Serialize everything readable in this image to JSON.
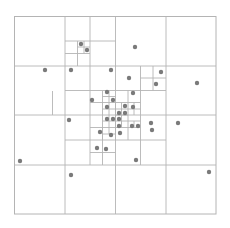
{
  "diagram": {
    "type": "quadtree",
    "line_color": "#b4b4b4",
    "point_color": "#7a7a7a",
    "point_radius": 2.2,
    "bounds": {
      "x": 14.5,
      "y": 16.5,
      "w": 201.5,
      "h": 197.5
    },
    "lines": [
      [
        65,
        16.5,
        65,
        214
      ],
      [
        115.5,
        16.5,
        115.5,
        214
      ],
      [
        166,
        16.5,
        166,
        214
      ],
      [
        14.5,
        66,
        216,
        66
      ],
      [
        14.5,
        115,
        216,
        115
      ],
      [
        14.5,
        165,
        216,
        165
      ],
      [
        90,
        16.5,
        90,
        66
      ],
      [
        65,
        41,
        115.5,
        41
      ],
      [
        77.5,
        41,
        77.5,
        66
      ],
      [
        65,
        53.5,
        90,
        53.5
      ],
      [
        84,
        41,
        84,
        53.5
      ],
      [
        77.5,
        47,
        90,
        47
      ],
      [
        140.5,
        66,
        140.5,
        115
      ],
      [
        115.5,
        90.5,
        166,
        90.5
      ],
      [
        153,
        66,
        153,
        90.5
      ],
      [
        140.5,
        78,
        166,
        78
      ],
      [
        90,
        66,
        90,
        165
      ],
      [
        65,
        90.5,
        115.5,
        90.5
      ],
      [
        65,
        140,
        166,
        140
      ],
      [
        140.5,
        115,
        140.5,
        165
      ],
      [
        102.5,
        90.5,
        102.5,
        140
      ],
      [
        128,
        90.5,
        128,
        140
      ],
      [
        90,
        102.5,
        140.5,
        102.5
      ],
      [
        90,
        127.5,
        140.5,
        127.5
      ],
      [
        109,
        90.5,
        109,
        102.5
      ],
      [
        102.5,
        96.5,
        115.5,
        96.5
      ],
      [
        109,
        102.5,
        109,
        127.5
      ],
      [
        121.5,
        102.5,
        121.5,
        127.5
      ],
      [
        102.5,
        109,
        128,
        109
      ],
      [
        102.5,
        121,
        128,
        121
      ],
      [
        115.5,
        102.5,
        115.5,
        127.5
      ],
      [
        128,
        109,
        140.5,
        109
      ],
      [
        134,
        102.5,
        134,
        115
      ],
      [
        115.5,
        115,
        128,
        115
      ],
      [
        121.5,
        121,
        121.5,
        127.5
      ],
      [
        128,
        121,
        140.5,
        121
      ],
      [
        134,
        121,
        134,
        127.5
      ],
      [
        102.5,
        127.5,
        102.5,
        140
      ],
      [
        115.5,
        127.5,
        115.5,
        140
      ],
      [
        109,
        127.5,
        109,
        134
      ],
      [
        102.5,
        134,
        115.5,
        134
      ],
      [
        102.5,
        140,
        102.5,
        165
      ],
      [
        90,
        152.5,
        115.5,
        152.5
      ],
      [
        52.5,
        91,
        52.5,
        115
      ]
    ],
    "points": [
      [
        135,
        47
      ],
      [
        81,
        44
      ],
      [
        87,
        50
      ],
      [
        45,
        70
      ],
      [
        71,
        70
      ],
      [
        111,
        70
      ],
      [
        129,
        78
      ],
      [
        161,
        72
      ],
      [
        156,
        84
      ],
      [
        197,
        83
      ],
      [
        92,
        100
      ],
      [
        107,
        92
      ],
      [
        113,
        100
      ],
      [
        133,
        93
      ],
      [
        107,
        107
      ],
      [
        125,
        106
      ],
      [
        133,
        107
      ],
      [
        119,
        113
      ],
      [
        125,
        113
      ],
      [
        107,
        119
      ],
      [
        113,
        119
      ],
      [
        119,
        119
      ],
      [
        119,
        126
      ],
      [
        132,
        126
      ],
      [
        138,
        126
      ],
      [
        100,
        132
      ],
      [
        111,
        135
      ],
      [
        120,
        133
      ],
      [
        97,
        148
      ],
      [
        106,
        149
      ],
      [
        69,
        120
      ],
      [
        20,
        161
      ],
      [
        71,
        175
      ],
      [
        178,
        123
      ],
      [
        151,
        123
      ],
      [
        136,
        160
      ],
      [
        209,
        172
      ],
      [
        152,
        130
      ]
    ]
  }
}
